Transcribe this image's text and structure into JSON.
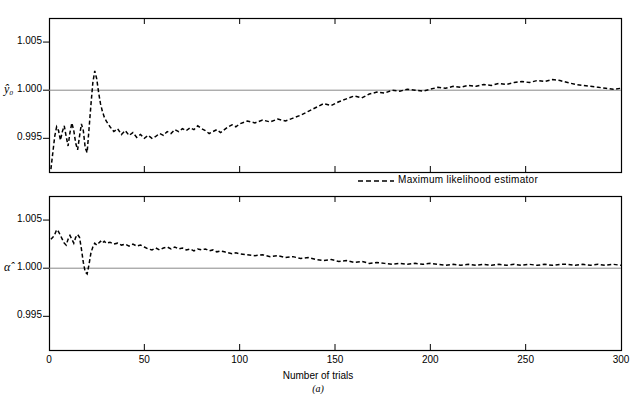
{
  "chart_data": {
    "type": "line",
    "title": "",
    "subtitle": "",
    "caption": "(a)",
    "xlabel": "Number of trials",
    "xlim": [
      0,
      300
    ],
    "xticks": [
      0,
      50,
      100,
      150,
      200,
      250,
      300
    ],
    "xticklabels": [
      "0",
      "50",
      "100",
      "150",
      "200",
      "250",
      "300"
    ],
    "grid": false,
    "legend": {
      "position": "between-panels-right",
      "entries": [
        {
          "label": "Maximum likelihood estimator",
          "style": "dashed",
          "color": "#000000"
        }
      ]
    },
    "panels": [
      {
        "id": "panel-y0",
        "ylabel": "ŷ₀",
        "ylim": [
          0.9915,
          1.0075
        ],
        "yticks": [
          0.995,
          1.0,
          1.005
        ],
        "yticklabels": [
          "0.995",
          "1.000",
          "1.005"
        ],
        "reference_line": 1.0,
        "series": [
          {
            "name": "Maximum likelihood estimator",
            "style": "dashed",
            "x": [
              1,
              2,
              3,
              4,
              5,
              6,
              7,
              8,
              9,
              10,
              11,
              12,
              13,
              14,
              15,
              16,
              17,
              18,
              19,
              20,
              21,
              22,
              23,
              24,
              25,
              26,
              27,
              28,
              29,
              30,
              32,
              34,
              36,
              38,
              40,
              42,
              44,
              46,
              48,
              50,
              52,
              54,
              56,
              58,
              60,
              62,
              64,
              66,
              68,
              70,
              72,
              74,
              76,
              78,
              80,
              82,
              84,
              86,
              88,
              90,
              92,
              94,
              96,
              98,
              100,
              104,
              108,
              112,
              116,
              120,
              124,
              128,
              132,
              136,
              140,
              144,
              148,
              152,
              156,
              160,
              164,
              168,
              172,
              176,
              180,
              184,
              188,
              192,
              196,
              200,
              204,
              208,
              212,
              216,
              220,
              224,
              228,
              232,
              236,
              240,
              244,
              248,
              252,
              256,
              260,
              264,
              268,
              272,
              276,
              280,
              284,
              288,
              292,
              296,
              300
            ],
            "y": [
              0.9918,
              0.9935,
              0.9952,
              0.9962,
              0.9958,
              0.9948,
              0.9957,
              0.9963,
              0.9952,
              0.9942,
              0.9956,
              0.9966,
              0.9958,
              0.9945,
              0.9938,
              0.9952,
              0.9965,
              0.9958,
              0.994,
              0.9935,
              0.996,
              0.9985,
              1.0008,
              1.002,
              1.0012,
              0.9998,
              0.9986,
              0.9978,
              0.9972,
              0.9968,
              0.9962,
              0.9957,
              0.996,
              0.9954,
              0.9958,
              0.9953,
              0.9956,
              0.9951,
              0.9954,
              0.995,
              0.9953,
              0.995,
              0.9952,
              0.9955,
              0.9953,
              0.9957,
              0.9955,
              0.9959,
              0.9957,
              0.996,
              0.9958,
              0.9961,
              0.9959,
              0.9963,
              0.996,
              0.9958,
              0.9955,
              0.9957,
              0.9959,
              0.9956,
              0.9959,
              0.9962,
              0.9964,
              0.9962,
              0.9965,
              0.9968,
              0.9966,
              0.9969,
              0.9967,
              0.997,
              0.9968,
              0.9971,
              0.9974,
              0.9978,
              0.9982,
              0.9986,
              0.9984,
              0.9988,
              0.9991,
              0.9994,
              0.9992,
              0.9996,
              0.9998,
              0.9997,
              1.0,
              0.9999,
              1.0001,
              1.0,
              0.9999,
              1.0001,
              1.0003,
              1.0002,
              1.0004,
              1.0003,
              1.0005,
              1.0004,
              1.0006,
              1.0005,
              1.0007,
              1.0006,
              1.0008,
              1.0009,
              1.0008,
              1.001,
              1.0009,
              1.0011,
              1.001,
              1.0008,
              1.0006,
              1.0005,
              1.0004,
              1.0003,
              1.0002,
              1.0001,
              1.0002
            ]
          }
        ]
      },
      {
        "id": "panel-alpha",
        "ylabel": "α̂",
        "ylim": [
          0.9915,
          1.0075
        ],
        "yticks": [
          0.995,
          1.0,
          1.005
        ],
        "yticklabels": [
          "0.995",
          "1.000",
          "1.005"
        ],
        "reference_line": 1.0,
        "series": [
          {
            "name": "Maximum likelihood estimator",
            "style": "dashed",
            "x": [
              1,
              2,
              3,
              4,
              5,
              6,
              7,
              8,
              9,
              10,
              11,
              12,
              13,
              14,
              15,
              16,
              17,
              18,
              19,
              20,
              21,
              22,
              23,
              24,
              25,
              26,
              27,
              28,
              29,
              30,
              32,
              34,
              36,
              38,
              40,
              42,
              44,
              46,
              48,
              50,
              52,
              54,
              56,
              58,
              60,
              62,
              64,
              66,
              68,
              70,
              72,
              74,
              76,
              78,
              80,
              82,
              84,
              86,
              88,
              90,
              92,
              94,
              96,
              98,
              100,
              104,
              108,
              112,
              116,
              120,
              124,
              128,
              132,
              136,
              140,
              144,
              148,
              152,
              156,
              160,
              164,
              168,
              172,
              176,
              180,
              184,
              188,
              192,
              196,
              200,
              204,
              208,
              212,
              216,
              220,
              224,
              228,
              232,
              236,
              240,
              244,
              248,
              252,
              256,
              260,
              264,
              268,
              272,
              276,
              280,
              284,
              288,
              292,
              296,
              300
            ],
            "y": [
              1.003,
              1.0032,
              1.0035,
              1.004,
              1.0038,
              1.0034,
              1.003,
              1.0026,
              1.0024,
              1.003,
              1.0034,
              1.003,
              1.0026,
              1.0032,
              1.0035,
              1.0032,
              1.002,
              1.0006,
              0.9996,
              0.9994,
              1.0004,
              1.0016,
              1.0022,
              1.0026,
              1.0024,
              1.0026,
              1.0028,
              1.0026,
              1.0028,
              1.0026,
              1.0027,
              1.0025,
              1.0026,
              1.0024,
              1.0025,
              1.0023,
              1.0025,
              1.0023,
              1.0024,
              1.0022,
              1.002,
              1.0019,
              1.0021,
              1.0019,
              1.0021,
              1.0022,
              1.002,
              1.0022,
              1.002,
              1.0021,
              1.0019,
              1.002,
              1.0018,
              1.002,
              1.0019,
              1.002,
              1.0018,
              1.0019,
              1.0017,
              1.0018,
              1.0017,
              1.0016,
              1.0015,
              1.0016,
              1.0015,
              1.0014,
              1.0013,
              1.0014,
              1.0012,
              1.0013,
              1.0011,
              1.0012,
              1.001,
              1.0011,
              1.0009,
              1.0008,
              1.0009,
              1.0007,
              1.0008,
              1.0006,
              1.0007,
              1.0005,
              1.0006,
              1.0005,
              1.0004,
              1.0005,
              1.0004,
              1.0005,
              1.0004,
              1.0005,
              1.0004,
              1.0003,
              1.0004,
              1.0003,
              1.0004,
              1.0003,
              1.0004,
              1.0003,
              1.0004,
              1.0003,
              1.0004,
              1.0003,
              1.0004,
              1.0003,
              1.0004,
              1.0003,
              1.0004,
              1.0004,
              1.0003,
              1.0004,
              1.0003,
              1.0004,
              1.0003,
              1.0004,
              1.0003
            ]
          }
        ]
      }
    ]
  }
}
